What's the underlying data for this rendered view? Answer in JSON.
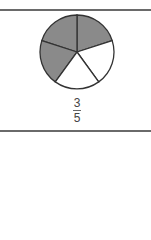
{
  "figure": {
    "total_parts": 5,
    "shaded_parts": 3,
    "shade_color": "#8a8a8a",
    "outline_color": "#333333"
  },
  "label": {
    "numerator": "3",
    "denominator": "5"
  }
}
